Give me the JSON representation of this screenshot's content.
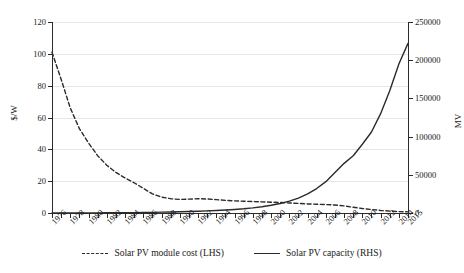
{
  "chart_data": {
    "type": "line",
    "title": "",
    "xlabel": "",
    "ylabel": "$/W",
    "ylabel_right": "MV",
    "grid": true,
    "legend_position": "bottom",
    "x": [
      1976,
      1977,
      1978,
      1979,
      1980,
      1981,
      1982,
      1983,
      1984,
      1985,
      1986,
      1987,
      1988,
      1989,
      1990,
      1991,
      1992,
      1993,
      1994,
      1995,
      1996,
      1997,
      1998,
      1999,
      2000,
      2001,
      2002,
      2003,
      2004,
      2005,
      2006,
      2007,
      2008,
      2009,
      2010,
      2011,
      2012,
      2013,
      2014,
      2015
    ],
    "xtick_labels": [
      "1976",
      "1978",
      "1980",
      "1982",
      "1984",
      "1986",
      "1988",
      "1990",
      "1992",
      "1994",
      "1996",
      "1998",
      "2000",
      "2002",
      "2004",
      "2006",
      "2008",
      "2010",
      "2012",
      "2014",
      "2015"
    ],
    "ylim": [
      0,
      120
    ],
    "ytick_labels": [
      "0",
      "20",
      "40",
      "60",
      "80",
      "100",
      "120"
    ],
    "ylim_right": [
      0,
      250000
    ],
    "ytick_labels_right": [
      "0",
      "50000",
      "100000",
      "150000",
      "200000",
      "250000"
    ],
    "series": [
      {
        "name": "Solar PV module cost (LHS)",
        "axis": "left",
        "style": "dashed",
        "unit": "$/W",
        "values": [
          101.0,
          84.0,
          66.0,
          53.0,
          44.0,
          36.0,
          30.0,
          25.5,
          22.0,
          19.0,
          15.5,
          12.0,
          10.0,
          9.0,
          8.5,
          8.7,
          9.0,
          8.8,
          8.4,
          7.9,
          7.6,
          7.4,
          7.2,
          7.0,
          6.8,
          6.6,
          6.3,
          6.0,
          5.7,
          5.5,
          5.3,
          5.0,
          4.5,
          3.6,
          2.8,
          2.2,
          1.6,
          1.2,
          0.9,
          0.7
        ]
      },
      {
        "name": "Solar PV capacity (RHS)",
        "axis": "right",
        "style": "solid",
        "unit": "MV",
        "values": [
          10,
          20,
          35,
          60,
          100,
          160,
          230,
          310,
          420,
          540,
          680,
          860,
          1080,
          1320,
          1600,
          1950,
          2350,
          2800,
          3300,
          3900,
          4600,
          5500,
          6700,
          8200,
          10100,
          12500,
          15500,
          19500,
          25000,
          32000,
          41000,
          53000,
          65000,
          75000,
          90000,
          106000,
          130000,
          160000,
          195000,
          222000
        ]
      }
    ]
  },
  "legend": {
    "items": [
      {
        "label": "Solar PV module cost (LHS)",
        "style": "dashed"
      },
      {
        "label": "Solar PV capacity (RHS)",
        "style": "solid"
      }
    ]
  },
  "colors": {
    "line": "#2b2b2b",
    "grid": "#e6e6e6",
    "axis": "#2b2b2b",
    "background": "#ffffff"
  }
}
